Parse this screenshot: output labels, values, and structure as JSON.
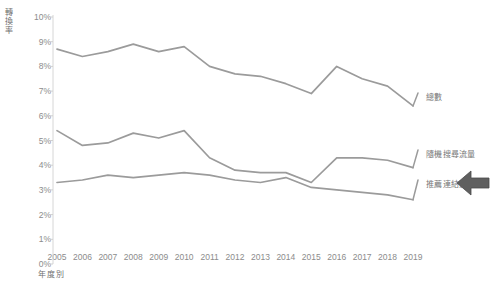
{
  "chart_data": {
    "type": "line",
    "title": "",
    "xlabel": "年度別",
    "ylabel": "轉換率",
    "grid": false,
    "legend_position": "right-end-labels",
    "x": [
      2005,
      2006,
      2007,
      2008,
      2009,
      2010,
      2011,
      2012,
      2013,
      2014,
      2015,
      2016,
      2017,
      2018,
      2019
    ],
    "categories": [
      "2005",
      "2006",
      "2007",
      "2008",
      "2009",
      "2010",
      "2011",
      "2012",
      "2013",
      "2014",
      "2015",
      "2016",
      "2017",
      "2018",
      "2019"
    ],
    "ylim": [
      0,
      10
    ],
    "ytick_labels": [
      "0%",
      "1%",
      "2%",
      "3%",
      "4%",
      "5%",
      "6%",
      "7%",
      "8%",
      "9%",
      "10%"
    ],
    "ytick_values": [
      0,
      1,
      2,
      3,
      4,
      5,
      6,
      7,
      8,
      9,
      10
    ],
    "yunit": "%",
    "series": [
      {
        "name": "總數",
        "color": "#9b9b9b",
        "values": [
          8.7,
          8.4,
          8.6,
          8.9,
          8.6,
          8.8,
          8.0,
          7.7,
          7.6,
          7.3,
          6.9,
          8.0,
          7.5,
          7.2,
          6.4
        ]
      },
      {
        "name": "隨機搜尋流量",
        "color": "#9b9b9b",
        "values": [
          5.4,
          4.8,
          4.9,
          5.3,
          5.1,
          5.4,
          4.3,
          3.8,
          3.7,
          3.7,
          3.3,
          4.3,
          4.3,
          4.2,
          3.9
        ]
      },
      {
        "name": "推薦連結流量",
        "color": "#9b9b9b",
        "values": [
          3.3,
          3.4,
          3.6,
          3.5,
          3.6,
          3.7,
          3.6,
          3.4,
          3.3,
          3.5,
          3.1,
          3.0,
          2.9,
          2.8,
          2.6
        ]
      }
    ]
  },
  "axis": {
    "y_title": "轉換率",
    "x_title": "年度別"
  },
  "cursor": {
    "name": "left-pointing-arrow",
    "x": 455,
    "y": 168
  }
}
